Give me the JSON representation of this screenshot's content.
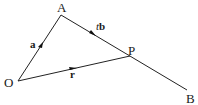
{
  "diagram": {
    "type": "vector-line-diagram",
    "points": {
      "O": {
        "label": "O",
        "x": 18,
        "y": 81
      },
      "A": {
        "label": "A",
        "x": 61,
        "y": 15
      },
      "P": {
        "label": "P",
        "x": 130,
        "y": 56
      },
      "B": {
        "label": "B",
        "x": 187,
        "y": 90
      }
    },
    "segments": [
      {
        "from": "O",
        "to": "A",
        "vector_label": "a",
        "arrow": true
      },
      {
        "from": "A",
        "to": "P",
        "vector_label_scalar": "t",
        "vector_label": "b",
        "arrow": true
      },
      {
        "from": "P",
        "to": "B",
        "arrow": false
      },
      {
        "from": "O",
        "to": "P",
        "vector_label": "r",
        "arrow": true
      }
    ],
    "labels": {
      "O": "O",
      "A": "A",
      "P": "P",
      "B": "B",
      "a": "a",
      "tb_scalar": "t",
      "tb_vector": "b",
      "r": "r"
    },
    "colors": {
      "line": "#222222",
      "text": "#1a1a1a",
      "background": "#ffffff"
    }
  }
}
